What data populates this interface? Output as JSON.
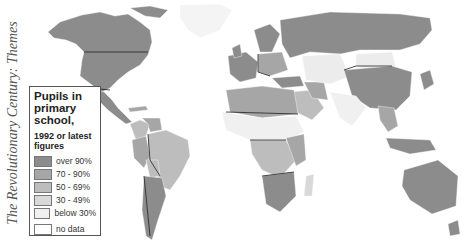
{
  "side_title": "The Revolutionary Century: Themes",
  "legend": {
    "title": "Pupils in primary school,",
    "subtitle": "1992 or latest figures",
    "items": [
      {
        "label": "over 90%",
        "color": "#8c8c8c"
      },
      {
        "label": "70 - 90%",
        "color": "#a6a6a6"
      },
      {
        "label": "50 - 69%",
        "color": "#bdbdbd"
      },
      {
        "label": "30 - 49%",
        "color": "#d9d9d9"
      },
      {
        "label": "below 30%",
        "color": "#f0f0f0"
      },
      {
        "label": "no data",
        "color": "#ffffff"
      }
    ]
  },
  "colors": {
    "border": "#222222",
    "ocean": "#ffffff"
  }
}
